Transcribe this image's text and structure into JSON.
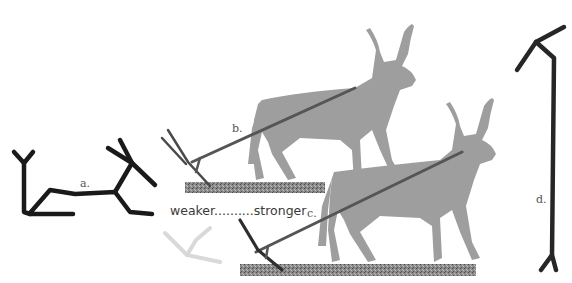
{
  "figure": {
    "labels": {
      "a": "a.",
      "b": "b.",
      "c": "c.",
      "d": "d."
    },
    "scale_caption": "weaker..........stronger",
    "colors": {
      "ink_dark": "#1a1a1a",
      "ox_fill": "#9e9e9e",
      "plough_beam": "#555555",
      "ground": "#7a7a7a",
      "ghost_plough": "#d6d6d6",
      "background": "#ffffff"
    },
    "elements": [
      {
        "id": "a",
        "description": "schematic plough-and-ox petroglyph"
      },
      {
        "id": "b",
        "description": "ox pulling plough over furrow"
      },
      {
        "id": "c",
        "description": "ox pulling plough over furrow (stronger)"
      },
      {
        "id": "d",
        "description": "long plough / ard tool"
      }
    ]
  }
}
